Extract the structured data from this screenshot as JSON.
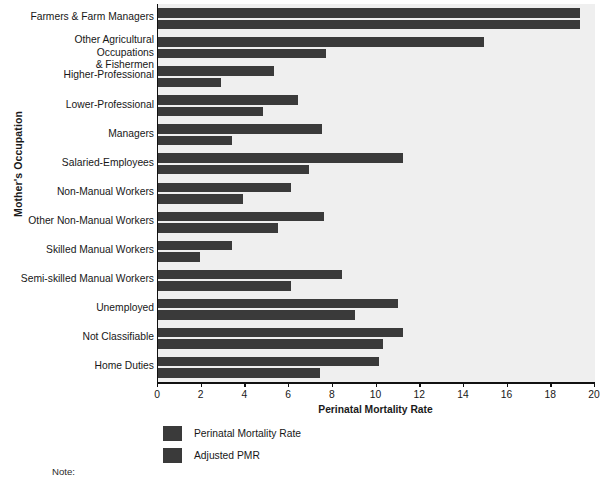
{
  "chart_data": {
    "type": "bar",
    "orientation": "horizontal",
    "title": "",
    "xlabel": "Perinatal Mortality Rate",
    "ylabel": "Mother's Occupation",
    "xlim": [
      0,
      20
    ],
    "xticks": [
      0,
      2,
      4,
      6,
      8,
      10,
      12,
      14,
      16,
      18,
      20
    ],
    "grid": false,
    "legend_position": "below-axis-left",
    "categories": [
      "Farmers & Farm Managers",
      "Other Agricultural Occupations\n& Fishermen",
      "Higher-Professional",
      "Lower-Professional",
      "Managers",
      "Salaried-Employees",
      "Non-Manual Workers",
      "Other Non-Manual Workers",
      "Skilled Manual Workers",
      "Semi-skilled Manual Workers",
      "Unemployed",
      "Not Classifiable",
      "Home Duties"
    ],
    "series": [
      {
        "name": "Perinatal Mortality Rate",
        "color": "#3a3a3a",
        "values": [
          19.3,
          14.9,
          5.3,
          6.4,
          7.5,
          11.2,
          6.1,
          7.6,
          3.4,
          8.4,
          11.0,
          11.2,
          10.1
        ]
      },
      {
        "name": "Adjusted PMR",
        "color": "#3a3a3a",
        "values": [
          19.3,
          7.7,
          2.9,
          4.8,
          3.4,
          6.9,
          3.9,
          5.5,
          1.9,
          6.1,
          9.0,
          10.3,
          7.4
        ]
      }
    ]
  },
  "legend": {
    "items": [
      {
        "label": "Perinatal Mortality Rate",
        "color": "#3a3a3a"
      },
      {
        "label": "Adjusted PMR",
        "color": "#3a3a3a"
      }
    ]
  },
  "note": {
    "label": "Note:"
  },
  "colors": {
    "bar": "#3a3a3a",
    "plot_background": "#efefef",
    "axis": "#111111",
    "page_background": "#ffffff"
  }
}
